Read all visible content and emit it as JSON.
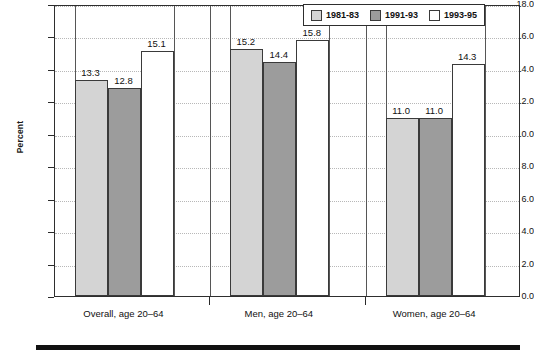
{
  "chart_data": {
    "type": "bar",
    "title": "",
    "xlabel": "",
    "ylabel": "Percent",
    "ylim": [
      0.0,
      18.0
    ],
    "ytick_step": 2.0,
    "ytick_labels": [
      "0.0",
      "2.0",
      "4.0",
      "6.0",
      "8.0",
      "10.0",
      "12.0",
      "14.0",
      "16.0",
      "18.0"
    ],
    "grid": true,
    "legend_position": "top-right",
    "categories": [
      "Overall, age 20–64",
      "Men, age 20–64",
      "Women, age 20–64"
    ],
    "series": [
      {
        "name": "1981-83",
        "color": "#d4d4d4",
        "values": [
          13.3,
          15.2,
          11.0
        ]
      },
      {
        "name": "1991-93",
        "color": "#9c9c9c",
        "values": [
          12.8,
          14.4,
          11.0
        ]
      },
      {
        "name": "1993-95",
        "color": "#ffffff",
        "values": [
          15.1,
          15.8,
          14.3
        ]
      }
    ],
    "data_labels": [
      [
        "13.3",
        "15.2",
        "11.0"
      ],
      [
        "12.8",
        "14.4",
        "11.0"
      ],
      [
        "15.1",
        "15.8",
        "14.3"
      ]
    ]
  },
  "legend": {
    "entries": [
      {
        "label": "1981-83"
      },
      {
        "label": "1991-93"
      },
      {
        "label": "1993-95"
      }
    ]
  },
  "axes": {
    "y_title": "Percent"
  }
}
